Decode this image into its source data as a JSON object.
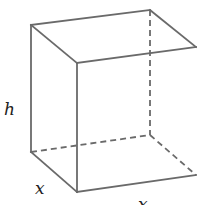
{
  "figure": {
    "line_color": "#6a6a6a",
    "label_color": "#222222",
    "vertices": {
      "back_top_left": [
        31,
        25
      ],
      "back_top_right": [
        150,
        10
      ],
      "front_top_left": [
        77,
        63
      ],
      "front_top_right": [
        196,
        47
      ],
      "back_bottom_left": [
        31,
        152
      ],
      "back_bottom_right": [
        150,
        135
      ],
      "front_bottom_left": [
        77,
        192
      ],
      "front_bottom_right": [
        196,
        175
      ]
    },
    "labels": {
      "height": "h",
      "depth": "x",
      "width": "x"
    }
  }
}
